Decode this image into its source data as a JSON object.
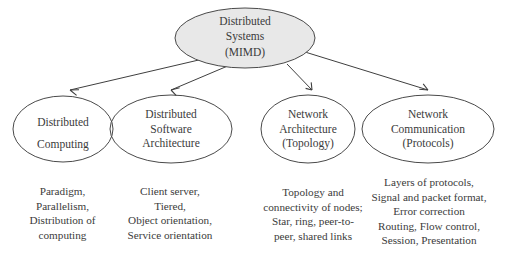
{
  "diagram": {
    "title_node": {
      "id": "distributed-systems-mimd",
      "label": "Distributed\nSystems\n(MIMD)",
      "fill": "#e8e8e8",
      "stroke": "#4a4a4a"
    },
    "branches": [
      {
        "id": "distributed-computing",
        "label": "Distributed\nComputing",
        "caption": "Paradigm,\nParallelism,\nDistribution of\ncomputing"
      },
      {
        "id": "distributed-software-architecture",
        "label": "Distributed\nSoftware\nArchitecture",
        "caption": "Client server,\nTiered,\nObject orientation,\nService orientation"
      },
      {
        "id": "network-architecture-topology",
        "label": "Network\nArchitecture\n(Topology)",
        "caption": "Topology and\nconnectivity of nodes;\nStar, ring, peer-to-\npeer, shared links"
      },
      {
        "id": "network-communication-protocols",
        "label": "Network\nCommunication\n(Protocols)",
        "caption": "Layers of protocols,\nSignal and packet format,\nError correction\nRouting, Flow control,\nSession, Presentation"
      }
    ],
    "colors": {
      "background": "#ffffff",
      "node_stroke": "#4a4a4a",
      "node_fill": "#ffffff",
      "root_fill": "#e8e8e8",
      "connector": "#3f3f3f",
      "text": "#3b3b3b"
    }
  }
}
